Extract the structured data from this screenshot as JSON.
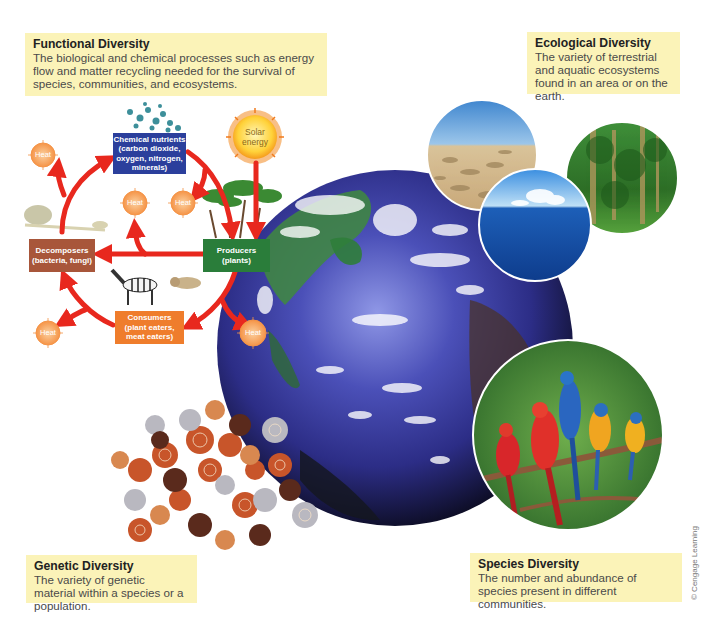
{
  "callouts": {
    "functional": {
      "title": "Functional Diversity",
      "body": "The biological and chemical processes such as energy flow and matter recycling needed for the survival of species, communities, and ecosystems."
    },
    "ecological": {
      "title": "Ecological Diversity",
      "body": "The variety of terrestrial and aquatic ecosystems found in an area or on the earth."
    },
    "genetic": {
      "title": "Genetic Diversity",
      "body": "The variety of genetic material within a species or a population."
    },
    "species": {
      "title": "Species Diversity",
      "body": "The number and abundance of species present in different communities."
    }
  },
  "cycle": {
    "chemical_nutrients": [
      "Chemical nutrients",
      "(carbon dioxide,",
      "oxygen, nitrogen,",
      "minerals)"
    ],
    "producers": [
      "Producers",
      "(plants)"
    ],
    "decomposers": [
      "Decomposers",
      "(bacteria, fungi)"
    ],
    "consumers": [
      "Consumers",
      "(plant eaters,",
      "meat eaters)"
    ],
    "solar_energy": [
      "Solar",
      "energy"
    ],
    "heat_label": "Heat"
  },
  "colors": {
    "callout_bg": "#fbf3b8",
    "arrow_red": "#e8281e",
    "chem_blue": "#2b3f9c",
    "producer_green": "#2a7d3a",
    "decomposer_brown": "#a8563a",
    "consumer_orange": "#ef7d2c",
    "heat_orange": "#f6a35a"
  },
  "credit": "© Cengage Learning"
}
